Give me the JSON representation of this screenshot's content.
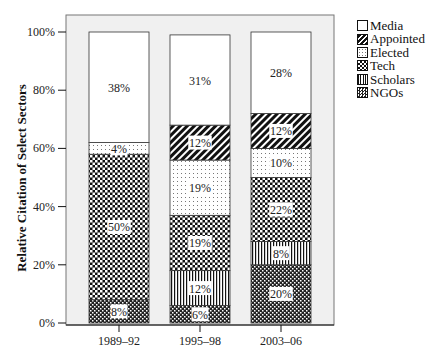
{
  "chart_data": {
    "type": "bar",
    "stacked": true,
    "title": "",
    "xlabel": "",
    "ylabel": "Relative Citation of Select Sectors",
    "ylim": [
      0,
      100
    ],
    "yticks": [
      "0%",
      "20%",
      "40%",
      "60%",
      "80%",
      "100%"
    ],
    "categories": [
      "1989–92",
      "1995–98",
      "2003–06"
    ],
    "series": [
      {
        "name": "NGOs",
        "pattern": "dense-checker",
        "values": [
          8,
          6,
          20
        ],
        "labels": [
          "8%",
          "6%",
          "20%"
        ]
      },
      {
        "name": "Scholars",
        "pattern": "vertical-lines",
        "values": [
          0,
          12,
          8
        ],
        "labels": [
          "",
          "12%",
          "8%"
        ]
      },
      {
        "name": "Tech",
        "pattern": "checker",
        "values": [
          50,
          19,
          22
        ],
        "labels": [
          "50%",
          "19%",
          "22%"
        ]
      },
      {
        "name": "Elected",
        "pattern": "dots",
        "values": [
          4,
          19,
          10
        ],
        "labels": [
          "4%",
          "19%",
          "10%"
        ]
      },
      {
        "name": "Appointed",
        "pattern": "diagonal-stripes",
        "values": [
          0,
          12,
          12
        ],
        "labels": [
          "",
          "12%",
          "12%"
        ]
      },
      {
        "name": "Media",
        "pattern": "solid-white",
        "values": [
          38,
          31,
          28
        ],
        "labels": [
          "38%",
          "31%",
          "28%"
        ]
      }
    ],
    "legend": [
      "Media",
      "Appointed",
      "Elected",
      "Tech",
      "Scholars",
      "NGOs"
    ],
    "legend_position": "right",
    "grid": false,
    "plot_background": "#f0f0f0"
  }
}
